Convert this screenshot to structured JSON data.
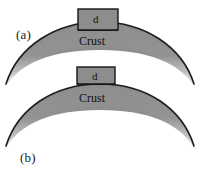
{
  "figure": {
    "width": 200,
    "height": 178,
    "background_color": "#ffffff",
    "crust_fill_color": "#8a8a8a",
    "crust_edge_color": "#1a1a1a",
    "box_fill_color": "#8d8d8d",
    "box_edge_color": "#151515",
    "text_color": "#111111"
  },
  "panels": [
    {
      "id": "a",
      "label": "(a)",
      "crust_label": "Crust",
      "box_label": "d",
      "box_shape": "tall-narrow"
    },
    {
      "id": "b",
      "label": "(b)",
      "crust_label": "Crust",
      "box_label": "d",
      "box_shape": "short-wide"
    }
  ]
}
